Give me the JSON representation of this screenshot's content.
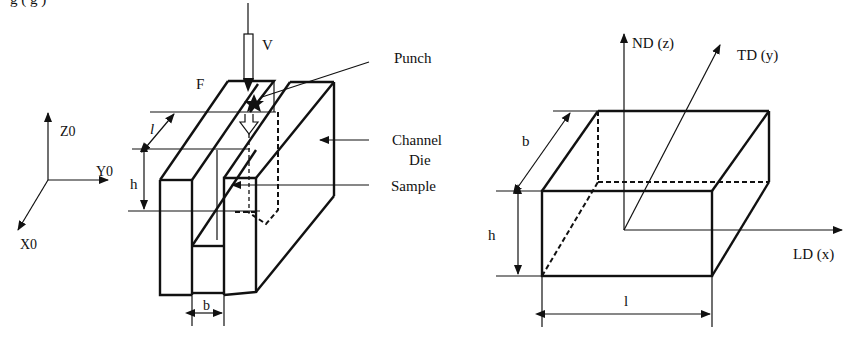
{
  "caption_fragment": {
    "text": "g                        ( g   )"
  },
  "left_figure": {
    "axes": {
      "z": "Z0",
      "y": "Y0",
      "x": "X0"
    },
    "labels": {
      "velocity": "V",
      "force": "F",
      "punch": "Punch",
      "channel_die_line1": "Channel",
      "channel_die_line2": "Die",
      "sample": "Sample",
      "dim_l": "l",
      "dim_h": "h",
      "dim_b": "b"
    }
  },
  "right_figure": {
    "axes": {
      "nd": "ND (z)",
      "td": "TD (y)",
      "ld": "LD (x)"
    },
    "labels": {
      "dim_b": "b",
      "dim_h": "h",
      "dim_l": "l"
    }
  },
  "colors": {
    "ink": "#111111",
    "background": "#ffffff"
  }
}
